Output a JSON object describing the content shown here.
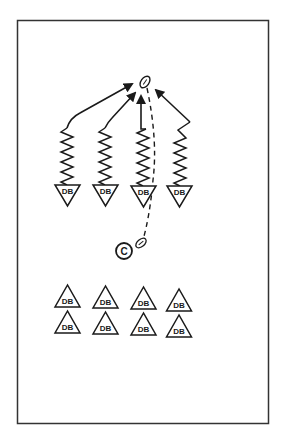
{
  "diagram": {
    "type": "football-drill",
    "colors": {
      "line": "#1a1a1a",
      "background": "#ffffff",
      "border": "#333333"
    },
    "field": {
      "x": 17,
      "y": 20,
      "width": 252,
      "height": 404
    },
    "ball_target": {
      "cx": 145,
      "cy": 82,
      "label": "football"
    },
    "coach": {
      "label": "C",
      "cx": 124,
      "cy": 251,
      "r": 8
    },
    "coach_ball": {
      "cx": 141,
      "cy": 243
    },
    "active_defenders": [
      {
        "label": "DB",
        "cx": 67,
        "top": 185
      },
      {
        "label": "DB",
        "cx": 105,
        "top": 185
      },
      {
        "label": "DB",
        "cx": 143,
        "top": 186
      },
      {
        "label": "DB",
        "cx": 180,
        "top": 186
      }
    ],
    "waiting_defenders": [
      {
        "label": "DB",
        "cx": 67,
        "apex": 285
      },
      {
        "label": "DB",
        "cx": 105,
        "apex": 286
      },
      {
        "label": "DB",
        "cx": 143,
        "apex": 287
      },
      {
        "label": "DB",
        "cx": 179,
        "apex": 289
      },
      {
        "label": "DB",
        "cx": 67,
        "apex": 311
      },
      {
        "label": "DB",
        "cx": 105,
        "apex": 312
      },
      {
        "label": "DB",
        "cx": 143,
        "apex": 313
      },
      {
        "label": "DB",
        "cx": 179,
        "apex": 315
      }
    ]
  }
}
